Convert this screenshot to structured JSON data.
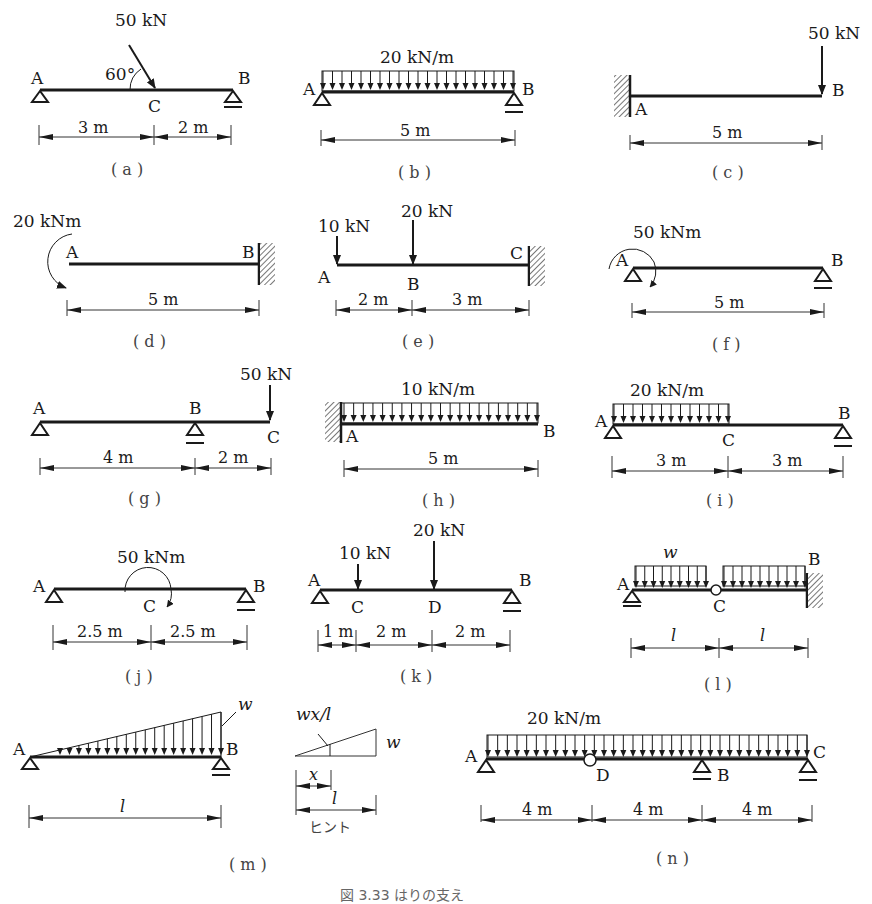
{
  "figure_caption": "図 3.33 はりの支え",
  "hint_label": "ヒント",
  "panels": {
    "a": {
      "caption": "( a )",
      "nodes": [
        "A",
        "C",
        "B"
      ],
      "load": "50 kN",
      "angle": "60°",
      "dims": [
        "3 m",
        "2 m"
      ]
    },
    "b": {
      "caption": "( b )",
      "nodes": [
        "A",
        "B"
      ],
      "load": "20 kN/m",
      "dims": [
        "5 m"
      ]
    },
    "c": {
      "caption": "( c )",
      "nodes": [
        "A",
        "B"
      ],
      "load": "50 kN",
      "dims": [
        "5 m"
      ]
    },
    "d": {
      "caption": "( d )",
      "nodes": [
        "A",
        "B"
      ],
      "load": "20 kNm",
      "dims": [
        "5 m"
      ]
    },
    "e": {
      "caption": "( e )",
      "nodes": [
        "A",
        "B",
        "C"
      ],
      "loads": [
        "10 kN",
        "20 kN"
      ],
      "dims": [
        "2 m",
        "3 m"
      ]
    },
    "f": {
      "caption": "( f )",
      "nodes": [
        "A",
        "B"
      ],
      "load": "50 kNm",
      "dims": [
        "5 m"
      ]
    },
    "g": {
      "caption": "( g )",
      "nodes": [
        "A",
        "B",
        "C"
      ],
      "load": "50 kN",
      "dims": [
        "4 m",
        "2 m"
      ]
    },
    "h": {
      "caption": "( h )",
      "nodes": [
        "A",
        "B"
      ],
      "load": "10 kN/m",
      "dims": [
        "5 m"
      ]
    },
    "i": {
      "caption": "( i )",
      "nodes": [
        "A",
        "C",
        "B"
      ],
      "load": "20 kN/m",
      "dims": [
        "3 m",
        "3 m"
      ]
    },
    "j": {
      "caption": "( j )",
      "nodes": [
        "A",
        "C",
        "B"
      ],
      "load": "50 kNm",
      "dims": [
        "2.5 m",
        "2.5 m"
      ]
    },
    "k": {
      "caption": "( k )",
      "nodes": [
        "A",
        "C",
        "D",
        "B"
      ],
      "loads": [
        "10 kN",
        "20 kN"
      ],
      "dims": [
        "1 m",
        "2 m",
        "2 m"
      ]
    },
    "l": {
      "caption": "( l )",
      "nodes": [
        "A",
        "C",
        "B"
      ],
      "load": "w",
      "dims": [
        "l",
        "l"
      ]
    },
    "m": {
      "caption": "( m )",
      "nodes": [
        "A",
        "B"
      ],
      "load": "w",
      "dims": [
        "l"
      ],
      "hint": {
        "formula": "wx/l",
        "w": "w",
        "x": "x",
        "l": "l"
      }
    },
    "n": {
      "caption": "( n )",
      "nodes": [
        "A",
        "D",
        "B",
        "C"
      ],
      "load": "20 kN/m",
      "dims": [
        "4 m",
        "4 m",
        "4 m"
      ]
    }
  }
}
